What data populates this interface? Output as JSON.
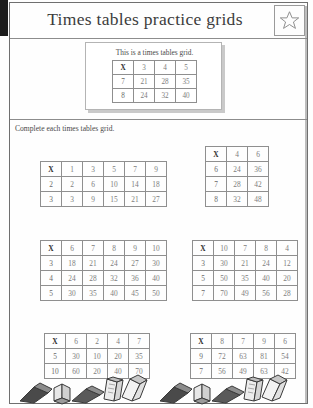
{
  "header": {
    "title": "Times tables practice grids",
    "star_icon": "star-icon"
  },
  "example": {
    "caption": "This is a times tables grid.",
    "grid": {
      "corner": "X",
      "columns": [
        "3",
        "4",
        "5"
      ],
      "rows": [
        {
          "header": "7",
          "values": [
            "21",
            "28",
            "35"
          ]
        },
        {
          "header": "8",
          "values": [
            "24",
            "32",
            "40"
          ]
        }
      ]
    }
  },
  "instruction": "Complete each times tables grid.",
  "grids": [
    {
      "corner": "X",
      "columns": [
        "1",
        "3",
        "5",
        "7",
        "9"
      ],
      "rows": [
        {
          "header": "2",
          "values": [
            "2",
            "6",
            "10",
            "14",
            "18"
          ]
        },
        {
          "header": "3",
          "values": [
            "3",
            "9",
            "15",
            "21",
            "27"
          ]
        }
      ]
    },
    {
      "corner": "X",
      "columns": [
        "4",
        "6"
      ],
      "rows": [
        {
          "header": "6",
          "values": [
            "24",
            "36"
          ]
        },
        {
          "header": "7",
          "values": [
            "28",
            "42"
          ]
        },
        {
          "header": "8",
          "values": [
            "32",
            "48"
          ]
        }
      ]
    },
    {
      "corner": "X",
      "columns": [
        "6",
        "7",
        "8",
        "9",
        "10"
      ],
      "rows": [
        {
          "header": "3",
          "values": [
            "18",
            "21",
            "24",
            "27",
            "30"
          ]
        },
        {
          "header": "4",
          "values": [
            "24",
            "28",
            "32",
            "36",
            "40"
          ]
        },
        {
          "header": "5",
          "values": [
            "30",
            "35",
            "40",
            "45",
            "50"
          ]
        }
      ]
    },
    {
      "corner": "X",
      "columns": [
        "10",
        "7",
        "8",
        "4"
      ],
      "rows": [
        {
          "header": "3",
          "values": [
            "30",
            "21",
            "24",
            "12"
          ]
        },
        {
          "header": "5",
          "values": [
            "50",
            "35",
            "40",
            "20"
          ]
        },
        {
          "header": "7",
          "values": [
            "70",
            "49",
            "56",
            "28"
          ]
        }
      ]
    },
    {
      "corner": "X",
      "columns": [
        "6",
        "2",
        "4",
        "7"
      ],
      "rows": [
        {
          "header": "5",
          "values": [
            "30",
            "10",
            "20",
            "35"
          ]
        },
        {
          "header": "10",
          "values": [
            "60",
            "20",
            "40",
            "70"
          ]
        }
      ]
    },
    {
      "corner": "X",
      "columns": [
        "8",
        "7",
        "9",
        "6"
      ],
      "rows": [
        {
          "header": "9",
          "values": [
            "72",
            "63",
            "81",
            "54"
          ]
        },
        {
          "header": "7",
          "values": [
            "56",
            "49",
            "63",
            "42"
          ]
        }
      ]
    }
  ],
  "footer": {
    "decoration": "books-illustration"
  },
  "colors": {
    "ink": "#4a4a4a",
    "grid_line": "#8f8f8f",
    "value_text": "#7d7d7d",
    "border": "#6f6f6f"
  }
}
